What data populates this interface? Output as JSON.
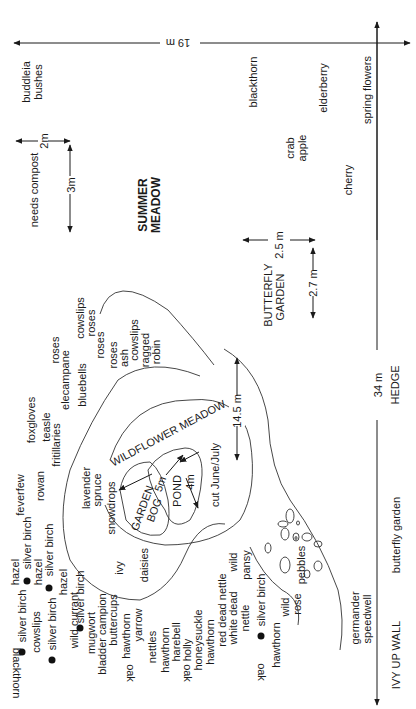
{
  "dimensions": {
    "top_width": "19 m",
    "side_length": "34 m",
    "compost_w": "2m",
    "compost_h": "3m",
    "butterfly_w": "2.5 m",
    "butterfly_h": "2.7 m",
    "meadow_depth": "14.5 m",
    "pond_w": "5m",
    "pond_h": "4m"
  },
  "areas": {
    "summer_meadow_1": "SUMMER",
    "summer_meadow_2": "MEADOW",
    "butterfly_garden_1": "BUTTERFLY",
    "butterfly_garden_2": "GARDEN",
    "wildflower_meadow": "WILDFLOWER MEADOW",
    "cut_note": "cut June/July",
    "garden_bog_1": "GARDEN",
    "garden_bog_2": "BOG",
    "pond": "POND",
    "needs_compost": "needs compost",
    "pebbles": "pebbles"
  },
  "boundaries": {
    "hedge": "HEDGE",
    "ivy_wall": "IVY UP WALL",
    "butterfly_garden_edge": "butterfly garden",
    "spring_flowers": "spring flowers"
  },
  "plants": {
    "buddleia_1": "buddleia",
    "buddleia_2": "bushes",
    "blackthorn_top": "blackthorn",
    "elderberry": "elderberry",
    "crab_1": "crab",
    "crab_2": "apple",
    "cherry": "cherry",
    "cowslips_a": "cowslips",
    "roses_a": "roses",
    "roses_b": "roses",
    "roses_c": "roses",
    "roses_d": "roses",
    "ash": "ash",
    "cowslips_b": "cowslips",
    "ragged_1": "ragged",
    "ragged_2": "robin",
    "elecampane": "elecampane",
    "bluebells": "bluebells",
    "foxgloves": "foxgloves",
    "teasle": "teasle",
    "fritillaries": "fritillaries",
    "feverfew": "feverfew",
    "rowan": "rowan",
    "lavender": "lavender",
    "spruce": "spruce",
    "snowdrops": "snowdrops",
    "ivy": "ivy",
    "daisies": "daisies",
    "hazel_1": "hazel",
    "silver_birch_1": "silver birch",
    "hazel_2": "hazel",
    "silver_birch_2": "silver birch",
    "hazel_3": "hazel",
    "silver_birch_3": "silver birch",
    "silver_birch_4": "silver birch",
    "cowslips_c": "cowslips",
    "silver_birch_5": "silver birch",
    "blackthorn_bottom": "blackthorn",
    "wild_currant": "wild currant",
    "silver_birch_6": "silver birch",
    "mugwort": "mugwort",
    "bladder_campion": "bladder campion",
    "buttercups": "buttercups",
    "hawthorn_1": "hawthorn",
    "oak_1": "oak",
    "yarrow": "yarrow",
    "nettles": "nettles",
    "hawthorn_2": "hawthorn",
    "harebell": "harebell",
    "holly": "holly",
    "oak_2": "oak",
    "honeysuckle": "honeysuckle",
    "hawthorn_3": "hawthorn",
    "red_dead_nettle": "red dead nettle",
    "white_dead": "white dead",
    "nettle": "nettle",
    "wild_pansy_1": "wild",
    "wild_pansy_2": "pansy",
    "silver_birch_7": "silver birch",
    "hawthorn_4": "hawthorn",
    "oak_3": "oak",
    "wild_rose_1": "wild",
    "wild_rose_2": "rose",
    "germander_1": "germander",
    "germander_2": "speedwell"
  }
}
